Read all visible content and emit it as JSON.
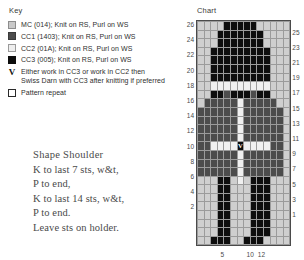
{
  "key": {
    "title": "Key",
    "items": [
      {
        "swatch": "mc-swatch",
        "color": "#c9c9c9",
        "label": "MC (014); Knit on RS, Purl on WS"
      },
      {
        "swatch": "cc1-swatch",
        "color": "#4c4c4c",
        "label": "CC1 (1403); Knit on RS, Purl on WS"
      },
      {
        "swatch": "cc2-swatch",
        "color": "#eeeeee",
        "label": "CC2 (01A); Knit on RS, Purl on WS"
      },
      {
        "swatch": "cc3-swatch",
        "color": "#0d0d0d",
        "label": "CC3 (005); Knit on RS, Purl on WS"
      },
      {
        "swatch": "v-symbol",
        "color": "#111111",
        "label": "Either work in CC3 or work in CC2 then",
        "label_line2": "Swiss Darn with CC3 after knitting if preferred"
      },
      {
        "swatch": "pattern-repeat-swatch",
        "color": "#ffffff",
        "label": "Pattern repeat"
      }
    ]
  },
  "instructions": {
    "heading": "Shape Shoulder",
    "lines": [
      "K to last 7 sts, w&t,",
      "P to end,",
      "K to last 14 sts, w&t,",
      "P to end.",
      "Leave sts on holder."
    ]
  },
  "chart": {
    "title": "Chart",
    "columns": 14,
    "rows": 26,
    "row_labels_left": [
      26,
      24,
      22,
      20,
      18,
      16,
      14,
      12,
      10,
      8,
      6,
      4,
      2
    ],
    "row_labels_right": [
      25,
      23,
      21,
      19,
      17,
      15,
      13,
      11,
      9,
      7,
      5,
      3,
      1
    ],
    "column_labels": [
      {
        "value": 12,
        "col": 12
      },
      {
        "value": 10,
        "col": 10
      },
      {
        "value": 5,
        "col": 5
      }
    ]
  },
  "chart_data": {
    "type": "heatmap",
    "title": "Chart",
    "xlabel": "",
    "ylabel": "",
    "palette": {
      "MC": "#cfcfcf",
      "CC1": "#4c4c4c",
      "CC2": "#f0f0f0",
      "CC3": "#0d0d0d",
      "V": "#0d0d0d"
    },
    "legend": [
      "MC (014); Knit on RS, Purl on WS",
      "CC1 (1403); Knit on RS, Purl on WS",
      "CC2 (01A); Knit on RS, Purl on WS",
      "CC3 (005); Knit on RS, Purl on WS",
      "Either work in CC3 or work in CC2 then Swiss Darn with CC3 after knitting if preferred",
      "Pattern repeat"
    ],
    "grid_on": true,
    "x": [
      1,
      2,
      3,
      4,
      5,
      6,
      7,
      8,
      9,
      10,
      11,
      12,
      13,
      14
    ],
    "y": [
      26,
      25,
      24,
      23,
      22,
      21,
      20,
      19,
      18,
      17,
      16,
      15,
      14,
      13,
      12,
      11,
      10,
      9,
      8,
      7,
      6,
      5,
      4,
      3,
      2,
      1
    ],
    "cells": [
      [
        "MC",
        "MC",
        "MC",
        "MC",
        "CC3",
        "CC3",
        "CC3",
        "CC3",
        "CC3",
        "MC",
        "MC",
        "MC",
        "MC",
        "MC"
      ],
      [
        "MC",
        "MC",
        "MC",
        "CC3",
        "CC3",
        "CC3",
        "CC3",
        "CC3",
        "CC3",
        "CC3",
        "MC",
        "MC",
        "MC",
        "MC"
      ],
      [
        "MC",
        "MC",
        "MC",
        "CC3",
        "CC3",
        "CC3",
        "CC3",
        "CC3",
        "CC3",
        "CC3",
        "MC",
        "MC",
        "MC",
        "MC"
      ],
      [
        "MC",
        "MC",
        "CC3",
        "CC3",
        "CC3",
        "CC3",
        "CC3",
        "CC3",
        "CC3",
        "CC3",
        "CC3",
        "MC",
        "MC",
        "MC"
      ],
      [
        "MC",
        "MC",
        "CC3",
        "CC3",
        "CC3",
        "CC3",
        "CC3",
        "CC3",
        "CC3",
        "CC3",
        "CC3",
        "MC",
        "MC",
        "MC"
      ],
      [
        "MC",
        "MC",
        "CC3",
        "CC3",
        "CC3",
        "CC3",
        "CC3",
        "CC3",
        "CC3",
        "CC3",
        "CC3",
        "MC",
        "MC",
        "MC"
      ],
      [
        "MC",
        "MC",
        "CC3",
        "CC3",
        "CC3",
        "CC3",
        "CC3",
        "CC3",
        "CC3",
        "CC3",
        "CC3",
        "MC",
        "MC",
        "MC"
      ],
      [
        "MC",
        "MC",
        "CC2",
        "CC2",
        "CC2",
        "CC2",
        "CC2",
        "CC2",
        "CC2",
        "CC2",
        "CC2",
        "MC",
        "MC",
        "MC"
      ],
      [
        "MC",
        "MC",
        "CC3",
        "CC3",
        "CC1",
        "CC3",
        "CC3",
        "CC3",
        "CC1",
        "CC3",
        "CC3",
        "MC",
        "MC",
        "MC"
      ],
      [
        "MC",
        "CC1",
        "CC1",
        "CC1",
        "CC1",
        "CC1",
        "CC2",
        "CC1",
        "CC1",
        "CC1",
        "CC1",
        "CC1",
        "MC",
        "MC"
      ],
      [
        "CC1",
        "CC1",
        "CC1",
        "CC1",
        "CC1",
        "CC1",
        "CC2",
        "CC1",
        "CC1",
        "CC1",
        "CC1",
        "CC1",
        "CC1",
        "MC"
      ],
      [
        "CC1",
        "CC1",
        "CC1",
        "CC1",
        "CC1",
        "CC1",
        "CC2",
        "CC1",
        "CC1",
        "CC1",
        "CC1",
        "CC1",
        "CC1",
        "MC"
      ],
      [
        "CC1",
        "CC1",
        "CC1",
        "CC1",
        "CC1",
        "CC1",
        "CC2",
        "CC1",
        "CC1",
        "CC1",
        "CC1",
        "CC1",
        "CC1",
        "MC"
      ],
      [
        "CC1",
        "CC1",
        "CC1",
        "CC1",
        "CC1",
        "CC1",
        "CC2",
        "CC1",
        "CC1",
        "CC1",
        "CC1",
        "CC1",
        "CC1",
        "MC"
      ],
      [
        "CC1",
        "CC1",
        "CC2",
        "CC2",
        "CC2",
        "CC2",
        "V",
        "CC2",
        "CC2",
        "CC2",
        "CC2",
        "CC1",
        "CC1",
        "MC"
      ],
      [
        "CC1",
        "CC1",
        "CC1",
        "CC1",
        "CC1",
        "CC1",
        "CC2",
        "CC1",
        "CC1",
        "CC1",
        "CC1",
        "CC1",
        "CC1",
        "MC"
      ],
      [
        "CC1",
        "CC1",
        "CC1",
        "CC1",
        "CC1",
        "CC1",
        "CC2",
        "CC1",
        "CC1",
        "CC1",
        "CC1",
        "CC1",
        "CC1",
        "MC"
      ],
      [
        "CC1",
        "CC1",
        "CC1",
        "CC1",
        "CC1",
        "CC1",
        "CC2",
        "CC1",
        "CC1",
        "CC1",
        "CC1",
        "CC1",
        "CC1",
        "MC"
      ],
      [
        "MC",
        "MC",
        "MC",
        "CC3",
        "CC3",
        "MC",
        "CC2",
        "MC",
        "CC3",
        "CC3",
        "CC3",
        "MC",
        "MC",
        "MC"
      ],
      [
        "MC",
        "MC",
        "MC",
        "CC3",
        "CC3",
        "MC",
        "MC",
        "MC",
        "CC3",
        "CC3",
        "CC3",
        "MC",
        "MC",
        "MC"
      ],
      [
        "MC",
        "MC",
        "MC",
        "CC3",
        "CC3",
        "MC",
        "MC",
        "MC",
        "CC3",
        "CC3",
        "CC3",
        "MC",
        "MC",
        "MC"
      ],
      [
        "MC",
        "MC",
        "MC",
        "CC3",
        "CC3",
        "MC",
        "MC",
        "MC",
        "CC3",
        "CC3",
        "CC3",
        "MC",
        "MC",
        "MC"
      ],
      [
        "MC",
        "MC",
        "MC",
        "CC3",
        "CC3",
        "MC",
        "MC",
        "MC",
        "CC3",
        "CC3",
        "CC3",
        "MC",
        "MC",
        "MC"
      ],
      [
        "MC",
        "MC",
        "MC",
        "CC3",
        "CC3",
        "MC",
        "MC",
        "MC",
        "CC3",
        "CC3",
        "CC3",
        "MC",
        "MC",
        "MC"
      ],
      [
        "MC",
        "MC",
        "MC",
        "CC3",
        "CC3",
        "MC",
        "MC",
        "MC",
        "CC3",
        "CC3",
        "CC3",
        "MC",
        "MC",
        "MC"
      ],
      [
        "MC",
        "MC",
        "CC3",
        "CC3",
        "CC3",
        "MC",
        "MC",
        "CC3",
        "CC3",
        "CC3",
        "MC",
        "MC",
        "MC",
        "MC"
      ]
    ]
  }
}
